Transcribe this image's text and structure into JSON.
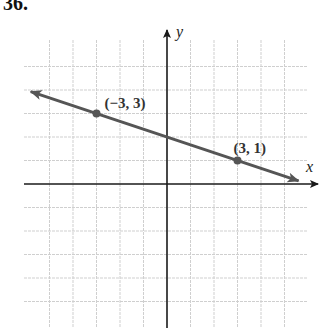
{
  "problem": {
    "number": "36."
  },
  "chart_data": {
    "type": "line",
    "title": "",
    "xlabel": "x",
    "ylabel": "y",
    "xlim": [
      -5,
      5.5
    ],
    "ylim": [
      -6,
      5
    ],
    "grid": true,
    "grid_step": 1,
    "tick_labels_shown": false,
    "series": [
      {
        "name": "line",
        "equation": "y = -x/3 + 2",
        "slope": -0.3333,
        "intercept": 2,
        "color": "#555555",
        "arrows_both_ends": true,
        "points": [
          {
            "x": -3,
            "y": 3,
            "label": "(−3, 3)"
          },
          {
            "x": 3,
            "y": 1,
            "label": "(3, 1)"
          }
        ]
      }
    ]
  },
  "colors": {
    "grid": "#cfcfcf",
    "axis": "#1a1a1a",
    "line": "#555555"
  }
}
